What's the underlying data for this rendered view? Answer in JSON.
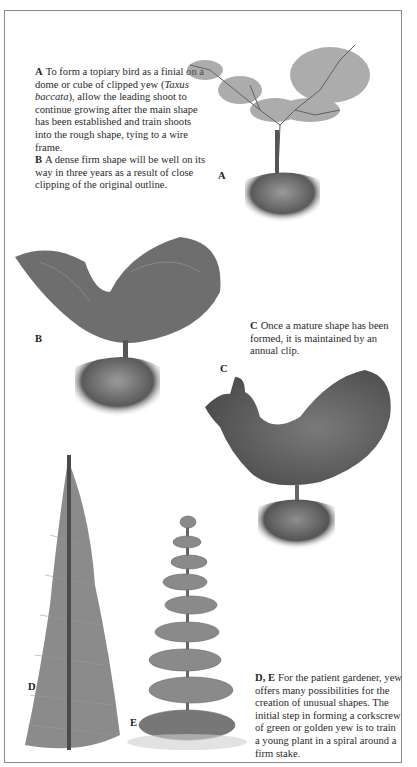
{
  "page": {
    "captions": {
      "a": {
        "label": "A",
        "text_before": "To form a topiary bird as a finial on a dome or cube of clipped yew (",
        "italic": "Taxus baccata",
        "text_after": "), allow the leading shoot to continue growing after the main shape has been established and train shoots into the rough shape, tying to a wire frame."
      },
      "b": {
        "label": "B",
        "text": "A dense firm shape will be well on its way in three years as a result of close clipping of the original outline."
      },
      "c": {
        "label": "C",
        "text": "Once a mature shape has been formed, it is maintained by an annual clip."
      },
      "de": {
        "label": "D, E",
        "text": "For the patient gardener, yew offers many possibilities for the creation of unusual shapes. The initial step in forming a corkscrew of green or golden yew is to train a young plant in a spiral around a firm stake."
      }
    },
    "figure_labels": {
      "a": "A",
      "b": "B",
      "c": "C",
      "d": "D",
      "e": "E"
    },
    "illustrations": [
      {
        "id": "A",
        "subject": "young yew trained into rough bird shape on clipped cube"
      },
      {
        "id": "B",
        "subject": "dense bird shape on clipped cube after three years"
      },
      {
        "id": "C",
        "subject": "mature clipped topiary bird on cube"
      },
      {
        "id": "D",
        "subject": "young yew tied to tall stake"
      },
      {
        "id": "E",
        "subject": "corkscrew spiral topiary"
      }
    ],
    "colors": {
      "frame": "#8a8a8a",
      "ink": "#2a2a2a",
      "foliage_dark": "#4a4a4a",
      "foliage_mid": "#7a7a7a"
    }
  }
}
